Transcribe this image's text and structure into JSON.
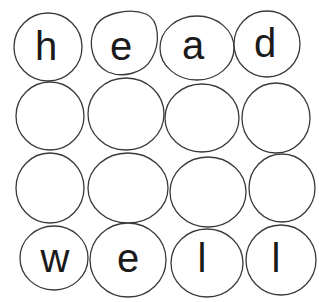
{
  "grid": {
    "rows": 4,
    "cols": 4,
    "stroke_color": "#3a3a3a",
    "letter_color": "#1a1a1a",
    "words": [
      "head",
      "",
      "",
      "well"
    ],
    "cells": [
      {
        "letter": "h"
      },
      {
        "letter": "e"
      },
      {
        "letter": "a"
      },
      {
        "letter": "d"
      },
      {
        "letter": ""
      },
      {
        "letter": ""
      },
      {
        "letter": ""
      },
      {
        "letter": ""
      },
      {
        "letter": ""
      },
      {
        "letter": ""
      },
      {
        "letter": ""
      },
      {
        "letter": ""
      },
      {
        "letter": "w"
      },
      {
        "letter": "e"
      },
      {
        "letter": "l"
      },
      {
        "letter": "l"
      }
    ]
  }
}
